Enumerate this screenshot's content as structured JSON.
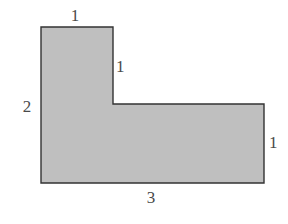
{
  "figure": {
    "kind": "geometry-diagram",
    "background_color": "#ffffff",
    "shape": {
      "name": "l-shape-polygon",
      "fill_color": "#bfbfbf",
      "stroke_color": "#333333",
      "stroke_width": 1.4,
      "points": "41,27 113,27 113,104 264,104 264,183 41,183"
    },
    "labels": [
      {
        "id": "top",
        "text": "1",
        "x": 75,
        "y": 15,
        "align": "center-x"
      },
      {
        "id": "inner-right",
        "text": "1",
        "x": 121,
        "y": 66,
        "align": "center-y"
      },
      {
        "id": "left",
        "text": "2",
        "x": 27,
        "y": 106,
        "align": "center-xy"
      },
      {
        "id": "far-right",
        "text": "1",
        "x": 273,
        "y": 142,
        "align": "center-y"
      },
      {
        "id": "bottom",
        "text": "3",
        "x": 151,
        "y": 197,
        "align": "center-x"
      }
    ]
  }
}
